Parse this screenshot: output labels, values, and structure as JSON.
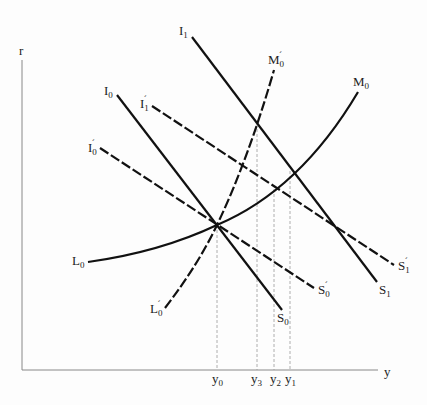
{
  "diagram": {
    "type": "IS-LM style economic diagram",
    "axes": {
      "y_axis_label": "r",
      "x_axis_label": "y"
    },
    "curves": [
      {
        "id": "I1S1",
        "start_label": "I",
        "start_sub": "1",
        "start_prime": "",
        "end_label": "S",
        "end_sub": "1",
        "end_prime": "",
        "style": "solid"
      },
      {
        "id": "I0S0",
        "start_label": "I",
        "start_sub": "0",
        "start_prime": "",
        "end_label": "S",
        "end_sub": "0",
        "end_prime": "",
        "style": "solid"
      },
      {
        "id": "I1pS1p",
        "start_label": "I",
        "start_sub": "1",
        "start_prime": "´",
        "end_label": "S",
        "end_sub": "1",
        "end_prime": "´",
        "style": "dashed"
      },
      {
        "id": "I0pS0p",
        "start_label": "I",
        "start_sub": "0",
        "start_prime": "´",
        "end_label": "S",
        "end_sub": "0",
        "end_prime": "´",
        "style": "dashed"
      },
      {
        "id": "L0M0",
        "start_label": "L",
        "start_sub": "0",
        "start_prime": "",
        "end_label": "M",
        "end_sub": "0",
        "end_prime": "",
        "style": "solid"
      },
      {
        "id": "L0pM0p",
        "start_label": "L",
        "start_sub": "0",
        "start_prime": "´",
        "end_label": "M",
        "end_sub": "0",
        "end_prime": "´",
        "style": "dashed"
      }
    ],
    "x_ticks": [
      {
        "label": "y",
        "sub": "0"
      },
      {
        "label": "y",
        "sub": "3"
      },
      {
        "label": "y",
        "sub": "2"
      },
      {
        "label": "y",
        "sub": "1"
      }
    ]
  }
}
